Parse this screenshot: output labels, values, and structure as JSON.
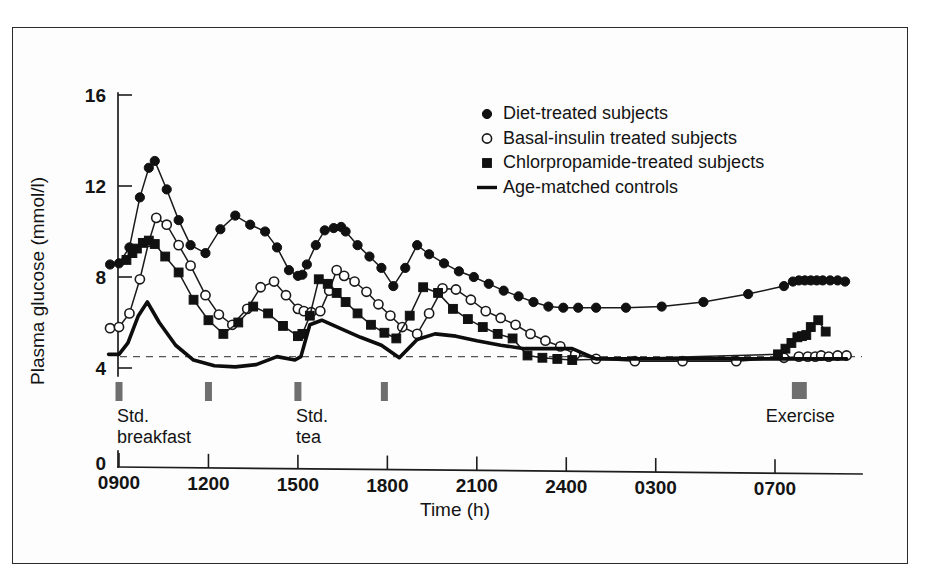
{
  "figure": {
    "frame_color": "#2b2b2b",
    "background": "#ffffff"
  },
  "axes": {
    "y_title": "Plasma glucose (mmol/l)",
    "x_title": "Time (h)",
    "y_ticks": [
      "0",
      "4",
      "8",
      "12",
      "16"
    ],
    "x_ticks": [
      "0900",
      "1200",
      "1500",
      "1800",
      "2100",
      "2400",
      "0300",
      "0700"
    ]
  },
  "legend": {
    "items": [
      {
        "label": "Diet-treated subjects",
        "marker": "filled-circle"
      },
      {
        "label": "Basal-insulin treated subjects",
        "marker": "open-circle"
      },
      {
        "label": "Chlorpropamide-treated subjects",
        "marker": "filled-square"
      },
      {
        "label": "Age-matched controls",
        "marker": "line"
      }
    ]
  },
  "annotations": [
    {
      "name": "std-breakfast",
      "label_line1": "Std.",
      "label_line2": "breakfast",
      "time": 900
    },
    {
      "name": "meal-marker-2",
      "label_line1": "",
      "label_line2": "",
      "time": 1200
    },
    {
      "name": "std-tea",
      "label_line1": "Std.",
      "label_line2": "tea",
      "time": 1500
    },
    {
      "name": "meal-marker-4",
      "label_line1": "",
      "label_line2": "",
      "time": 1800
    },
    {
      "name": "exercise",
      "label_line1": "Exercise",
      "label_line2": "",
      "time": 720
    }
  ],
  "chart_data": {
    "type": "line",
    "title": "",
    "xlabel": "Time (h)",
    "ylabel": "Plasma glucose (mmol/l)",
    "ylim": [
      0,
      16
    ],
    "y_axis_break": true,
    "y_break_between": [
      0,
      4
    ],
    "grid": false,
    "legend_position": "top-right",
    "x_tick_labels": [
      "0900",
      "1200",
      "1500",
      "1800",
      "2100",
      "2400",
      "0300",
      "0700"
    ],
    "x_tick_hours": [
      9,
      12,
      15,
      18,
      21,
      24,
      27,
      31
    ],
    "x_range_hours": [
      8.6,
      33.6
    ],
    "reference_line": {
      "label": "control baseline",
      "value": 4.5,
      "style": "dashed"
    },
    "meal_markers_hours": [
      9.0,
      12.0,
      15.0,
      17.9
    ],
    "exercise_marker_hours": [
      31.6,
      32.1
    ],
    "series": [
      {
        "name": "Diet-treated subjects",
        "marker": "filled-circle",
        "x": [
          8.7,
          9.0,
          9.35,
          9.7,
          10.0,
          10.2,
          10.6,
          11.0,
          11.4,
          11.9,
          12.4,
          12.9,
          13.4,
          13.9,
          14.3,
          14.7,
          15.0,
          15.15,
          15.3,
          15.6,
          15.9,
          16.2,
          16.45,
          16.6,
          17.0,
          17.4,
          17.8,
          18.2,
          18.6,
          19.0,
          19.4,
          19.9,
          20.4,
          20.9,
          21.4,
          21.9,
          22.4,
          22.9,
          23.4,
          23.9,
          24.4,
          25.0,
          26.0,
          27.2,
          28.6,
          30.1,
          31.3,
          31.6,
          31.8,
          32.0,
          32.2,
          32.4,
          32.6,
          32.85,
          33.1,
          33.35
        ],
        "y": [
          8.55,
          8.6,
          9.3,
          11.5,
          12.8,
          13.1,
          11.85,
          10.5,
          9.4,
          9.05,
          10.1,
          10.7,
          10.3,
          10.0,
          9.3,
          8.3,
          8.05,
          8.1,
          8.55,
          9.4,
          10.05,
          10.15,
          10.2,
          10.0,
          9.4,
          8.9,
          8.4,
          7.6,
          8.4,
          9.4,
          9.0,
          8.6,
          8.25,
          8.0,
          7.7,
          7.4,
          7.15,
          6.9,
          6.7,
          6.65,
          6.65,
          6.65,
          6.65,
          6.7,
          6.9,
          7.25,
          7.6,
          7.8,
          7.85,
          7.85,
          7.85,
          7.85,
          7.85,
          7.85,
          7.85,
          7.8
        ]
      },
      {
        "name": "Basal-insulin treated subjects",
        "marker": "open-circle",
        "x": [
          8.7,
          9.0,
          9.35,
          9.7,
          10.0,
          10.25,
          10.6,
          11.0,
          11.4,
          11.9,
          12.35,
          12.8,
          13.3,
          13.75,
          14.2,
          14.6,
          15.0,
          15.2,
          15.45,
          15.75,
          16.05,
          16.3,
          16.55,
          16.9,
          17.3,
          17.7,
          18.1,
          18.5,
          19.0,
          19.4,
          19.85,
          20.3,
          20.8,
          21.3,
          21.8,
          22.3,
          22.8,
          23.3,
          23.8,
          24.3,
          25.0,
          26.3,
          27.9,
          29.7,
          31.3,
          31.8,
          32.1,
          32.35,
          32.55,
          32.8,
          33.1,
          33.4
        ],
        "y": [
          5.75,
          5.8,
          6.4,
          7.9,
          9.55,
          10.6,
          10.3,
          9.4,
          8.5,
          7.2,
          6.35,
          5.9,
          6.6,
          7.55,
          7.8,
          7.2,
          6.6,
          6.5,
          6.45,
          6.5,
          7.4,
          8.3,
          8.05,
          7.8,
          7.35,
          6.8,
          6.3,
          5.8,
          5.5,
          6.4,
          7.5,
          7.45,
          7.0,
          6.5,
          6.2,
          5.9,
          5.5,
          5.2,
          4.95,
          4.6,
          4.4,
          4.3,
          4.3,
          4.3,
          4.45,
          4.5,
          4.5,
          4.5,
          4.55,
          4.5,
          4.55,
          4.55
        ]
      },
      {
        "name": "Chlorpropamide-treated subjects",
        "marker": "filled-square",
        "x": [
          9.25,
          9.45,
          9.6,
          9.8,
          10.0,
          10.2,
          10.55,
          11.0,
          11.5,
          12.0,
          12.5,
          13.0,
          13.5,
          14.0,
          14.5,
          15.0,
          15.15,
          15.4,
          15.7,
          16.0,
          16.3,
          16.6,
          17.0,
          17.45,
          17.9,
          18.3,
          18.75,
          19.2,
          19.7,
          20.2,
          20.7,
          21.2,
          21.7,
          22.2,
          22.7,
          23.2,
          23.7,
          24.2,
          31.1,
          31.35,
          31.55,
          31.75,
          31.9,
          32.05,
          32.2,
          32.45,
          32.7
        ],
        "y": [
          8.75,
          9.05,
          9.25,
          9.5,
          9.6,
          9.45,
          8.9,
          8.2,
          7.0,
          6.1,
          5.5,
          6.0,
          6.7,
          6.4,
          5.85,
          5.4,
          5.5,
          6.3,
          7.9,
          7.7,
          7.3,
          6.9,
          6.4,
          5.9,
          5.55,
          5.3,
          6.3,
          7.55,
          7.3,
          6.6,
          6.15,
          5.8,
          5.5,
          5.3,
          4.55,
          4.45,
          4.4,
          4.35,
          4.6,
          4.85,
          5.1,
          5.35,
          5.4,
          5.45,
          5.8,
          6.1,
          5.6
        ]
      },
      {
        "name": "Age-matched controls",
        "marker": "line",
        "x": [
          8.65,
          9.0,
          9.3,
          9.65,
          9.95,
          10.35,
          10.9,
          11.5,
          12.2,
          12.9,
          13.6,
          14.3,
          14.9,
          15.1,
          15.4,
          15.8,
          16.4,
          17.1,
          17.8,
          18.4,
          19.0,
          19.6,
          20.3,
          21.0,
          21.8,
          22.6,
          23.4,
          24.2,
          25.0,
          26.5,
          28.5,
          30.5,
          31.5,
          32.3,
          33.4
        ],
        "y": [
          4.6,
          4.6,
          5.1,
          6.3,
          6.9,
          6.0,
          5.0,
          4.35,
          4.1,
          4.05,
          4.15,
          4.5,
          4.35,
          4.5,
          5.9,
          6.1,
          5.75,
          5.35,
          5.0,
          4.45,
          5.25,
          5.5,
          5.4,
          5.2,
          5.0,
          4.85,
          4.85,
          4.85,
          4.4,
          4.4,
          4.4,
          4.4,
          4.4,
          4.4,
          4.4
        ]
      }
    ]
  }
}
